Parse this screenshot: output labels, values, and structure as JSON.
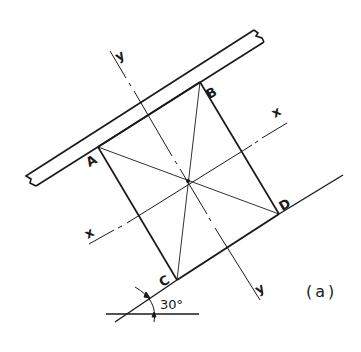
{
  "figure": {
    "caption": "(a)",
    "points": {
      "A": "A",
      "B": "B",
      "C": "C",
      "D": "D"
    },
    "axes": {
      "x_top": "x",
      "x_bottom": "x",
      "y_top": "y",
      "y_bottom": "y"
    },
    "angle": {
      "value": "30°"
    },
    "colors": {
      "ink": "#1a1a1a",
      "background": "#ffffff"
    }
  }
}
